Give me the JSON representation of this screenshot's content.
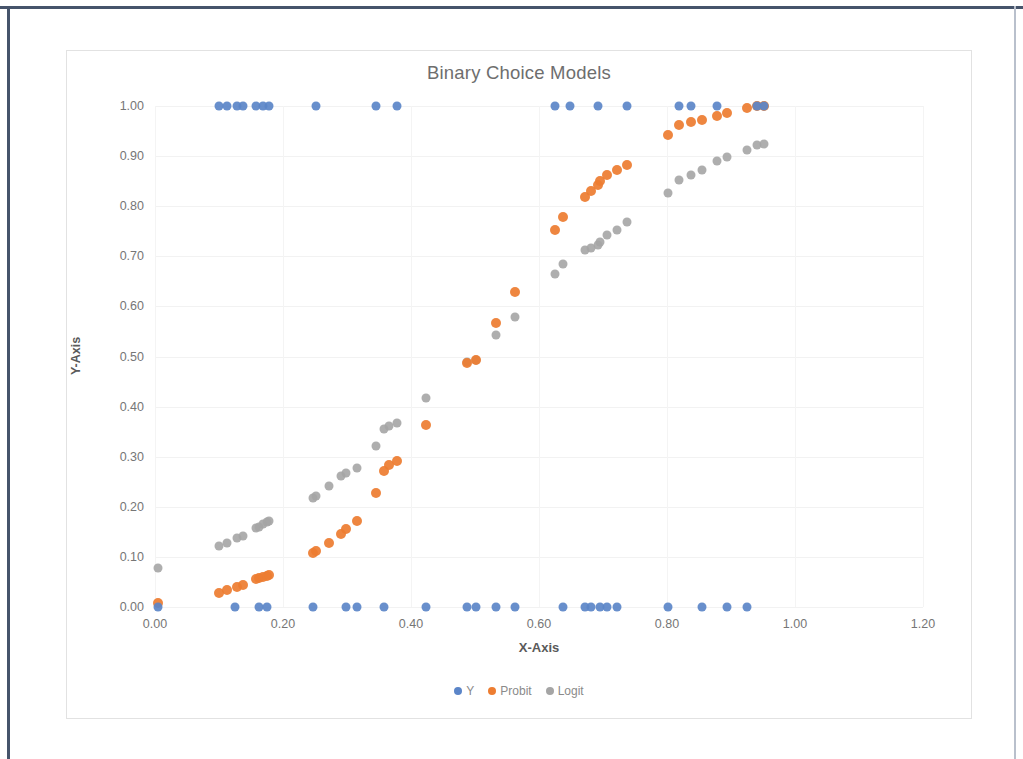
{
  "chart_data": {
    "type": "scatter",
    "title": "Binary Choice Models",
    "xlabel": "X-Axis",
    "ylabel": "Y-Axis",
    "xlim": [
      0.0,
      1.2
    ],
    "ylim": [
      0.0,
      1.0
    ],
    "xticks": [
      "0.00",
      "0.20",
      "0.40",
      "0.60",
      "0.80",
      "1.00",
      "1.20"
    ],
    "xtick_values": [
      0.0,
      0.2,
      0.4,
      0.6,
      0.8,
      1.0,
      1.2
    ],
    "yticks": [
      "0.00",
      "0.10",
      "0.20",
      "0.30",
      "0.40",
      "0.50",
      "0.60",
      "0.70",
      "0.80",
      "0.90",
      "1.00"
    ],
    "ytick_values": [
      0.0,
      0.1,
      0.2,
      0.3,
      0.4,
      0.5,
      0.6,
      0.7,
      0.8,
      0.9,
      1.0
    ],
    "grid": true,
    "legend_position": "bottom",
    "colors": {
      "Y": "#5b85c8",
      "Probit": "#ed7d31",
      "Logit": "#a5a5a5"
    },
    "series": [
      {
        "name": "Y",
        "color": "#5b85c8",
        "points": [
          [
            0.005,
            0.0
          ],
          [
            0.125,
            0.0
          ],
          [
            0.163,
            0.0
          ],
          [
            0.175,
            0.0
          ],
          [
            0.247,
            0.0
          ],
          [
            0.298,
            0.0
          ],
          [
            0.316,
            0.0
          ],
          [
            0.358,
            0.0
          ],
          [
            0.423,
            0.0
          ],
          [
            0.487,
            0.0
          ],
          [
            0.502,
            0.0
          ],
          [
            0.533,
            0.0
          ],
          [
            0.562,
            0.0
          ],
          [
            0.638,
            0.0
          ],
          [
            0.672,
            0.0
          ],
          [
            0.681,
            0.0
          ],
          [
            0.695,
            0.0
          ],
          [
            0.706,
            0.0
          ],
          [
            0.722,
            0.0
          ],
          [
            0.802,
            0.0
          ],
          [
            0.855,
            0.0
          ],
          [
            0.893,
            0.0
          ],
          [
            0.925,
            0.0
          ],
          [
            0.1,
            1.0
          ],
          [
            0.113,
            1.0
          ],
          [
            0.128,
            1.0
          ],
          [
            0.137,
            1.0
          ],
          [
            0.158,
            1.0
          ],
          [
            0.168,
            1.0
          ],
          [
            0.178,
            1.0
          ],
          [
            0.252,
            1.0
          ],
          [
            0.345,
            1.0
          ],
          [
            0.378,
            1.0
          ],
          [
            0.625,
            1.0
          ],
          [
            0.648,
            1.0
          ],
          [
            0.692,
            1.0
          ],
          [
            0.737,
            1.0
          ],
          [
            0.818,
            1.0
          ],
          [
            0.838,
            1.0
          ],
          [
            0.878,
            1.0
          ],
          [
            0.94,
            1.0
          ],
          [
            0.952,
            1.0
          ]
        ]
      },
      {
        "name": "Probit",
        "color": "#ed7d31",
        "points": [
          [
            0.005,
            0.008
          ],
          [
            0.1,
            0.028
          ],
          [
            0.113,
            0.033
          ],
          [
            0.128,
            0.04
          ],
          [
            0.137,
            0.044
          ],
          [
            0.158,
            0.055
          ],
          [
            0.163,
            0.057
          ],
          [
            0.168,
            0.06
          ],
          [
            0.175,
            0.062
          ],
          [
            0.178,
            0.063
          ],
          [
            0.247,
            0.108
          ],
          [
            0.252,
            0.112
          ],
          [
            0.272,
            0.128
          ],
          [
            0.29,
            0.146
          ],
          [
            0.298,
            0.155
          ],
          [
            0.316,
            0.172
          ],
          [
            0.345,
            0.228
          ],
          [
            0.358,
            0.272
          ],
          [
            0.365,
            0.283
          ],
          [
            0.378,
            0.292
          ],
          [
            0.423,
            0.363
          ],
          [
            0.487,
            0.488
          ],
          [
            0.502,
            0.494
          ],
          [
            0.533,
            0.567
          ],
          [
            0.562,
            0.628
          ],
          [
            0.625,
            0.752
          ],
          [
            0.638,
            0.778
          ],
          [
            0.672,
            0.818
          ],
          [
            0.681,
            0.83
          ],
          [
            0.692,
            0.842
          ],
          [
            0.695,
            0.85
          ],
          [
            0.706,
            0.862
          ],
          [
            0.722,
            0.872
          ],
          [
            0.737,
            0.882
          ],
          [
            0.802,
            0.942
          ],
          [
            0.818,
            0.963
          ],
          [
            0.838,
            0.968
          ],
          [
            0.855,
            0.972
          ],
          [
            0.878,
            0.98
          ],
          [
            0.893,
            0.986
          ],
          [
            0.925,
            0.996
          ],
          [
            0.94,
            1.0
          ],
          [
            0.952,
            1.0
          ]
        ]
      },
      {
        "name": "Logit",
        "color": "#a5a5a5",
        "points": [
          [
            0.005,
            0.078
          ],
          [
            0.1,
            0.122
          ],
          [
            0.113,
            0.128
          ],
          [
            0.128,
            0.138
          ],
          [
            0.137,
            0.142
          ],
          [
            0.158,
            0.158
          ],
          [
            0.163,
            0.16
          ],
          [
            0.168,
            0.165
          ],
          [
            0.175,
            0.17
          ],
          [
            0.178,
            0.172
          ],
          [
            0.247,
            0.218
          ],
          [
            0.252,
            0.222
          ],
          [
            0.272,
            0.242
          ],
          [
            0.29,
            0.262
          ],
          [
            0.298,
            0.268
          ],
          [
            0.316,
            0.278
          ],
          [
            0.345,
            0.322
          ],
          [
            0.358,
            0.355
          ],
          [
            0.365,
            0.362
          ],
          [
            0.378,
            0.368
          ],
          [
            0.423,
            0.418
          ],
          [
            0.487,
            0.49
          ],
          [
            0.502,
            0.494
          ],
          [
            0.533,
            0.542
          ],
          [
            0.562,
            0.578
          ],
          [
            0.625,
            0.665
          ],
          [
            0.638,
            0.685
          ],
          [
            0.672,
            0.712
          ],
          [
            0.681,
            0.716
          ],
          [
            0.692,
            0.722
          ],
          [
            0.695,
            0.728
          ],
          [
            0.706,
            0.742
          ],
          [
            0.722,
            0.752
          ],
          [
            0.737,
            0.768
          ],
          [
            0.802,
            0.826
          ],
          [
            0.818,
            0.852
          ],
          [
            0.838,
            0.862
          ],
          [
            0.855,
            0.872
          ],
          [
            0.878,
            0.89
          ],
          [
            0.893,
            0.898
          ],
          [
            0.925,
            0.912
          ],
          [
            0.94,
            0.922
          ],
          [
            0.952,
            0.925
          ]
        ]
      }
    ]
  },
  "legend": {
    "items": [
      {
        "label": "Y",
        "color": "#5b85c8"
      },
      {
        "label": "Probit",
        "color": "#ed7d31"
      },
      {
        "label": "Logit",
        "color": "#a5a5a5"
      }
    ]
  }
}
